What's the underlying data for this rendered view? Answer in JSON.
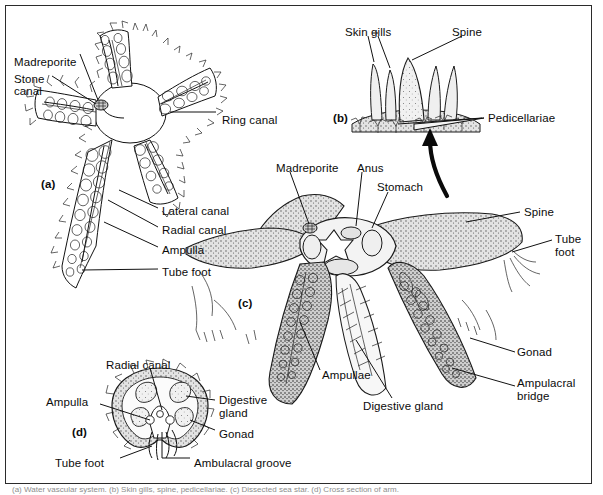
{
  "figure": {
    "panels": [
      {
        "id": "a",
        "tag": "(a)",
        "description": "water vascular system"
      },
      {
        "id": "b",
        "tag": "(b)",
        "description": "surface detail with skin gills, spine and pedicellariae"
      },
      {
        "id": "c",
        "tag": "(c)",
        "description": "whole animal dissected from aboral side"
      },
      {
        "id": "d",
        "tag": "(d)",
        "description": "cross section of an arm"
      }
    ],
    "panel_tags": {
      "a": "(a)",
      "b": "(b)",
      "c": "(c)",
      "d": "(d)"
    },
    "caption_sliver": "(a) Water vascular system. (b) Skin gills, spine, pedicellariae. (c) Dissected sea star. (d) Cross section of arm."
  },
  "labels": {
    "panel_a": [
      {
        "name": "madreporite",
        "text": "Madreporite",
        "x": 14,
        "y": 56
      },
      {
        "name": "stone-canal-line1",
        "text": "Stone",
        "x": 14,
        "y": 73
      },
      {
        "name": "stone-canal-line2",
        "text": "canal",
        "x": 14,
        "y": 85
      },
      {
        "name": "ring-canal",
        "text": "Ring canal",
        "x": 222,
        "y": 114
      },
      {
        "name": "lateral-canal",
        "text": "Lateral canal",
        "x": 162,
        "y": 211
      },
      {
        "name": "radial-canal",
        "text": "Radial canal",
        "x": 162,
        "y": 230
      },
      {
        "name": "ampulla",
        "text": "Ampulla",
        "x": 162,
        "y": 250
      },
      {
        "name": "tube-foot",
        "text": "Tube foot",
        "x": 162,
        "y": 272
      },
      {
        "name": "panel-a-tag",
        "text": "(a)",
        "x": 41,
        "y": 178,
        "bold": true
      }
    ],
    "panel_b": [
      {
        "name": "skin-gills",
        "text": "Skin gills",
        "x": 345,
        "y": 29
      },
      {
        "name": "spine",
        "text": "Spine",
        "x": 452,
        "y": 29
      },
      {
        "name": "pedicellariae",
        "text": "Pedicellariae",
        "x": 488,
        "y": 117
      },
      {
        "name": "panel-b-tag",
        "text": "(b)",
        "x": 333,
        "y": 117,
        "bold": true
      }
    ],
    "panel_c": [
      {
        "name": "madreporite-c",
        "text": "Madreporite",
        "x": 276,
        "y": 165
      },
      {
        "name": "anus",
        "text": "Anus",
        "x": 357,
        "y": 165
      },
      {
        "name": "stomach",
        "text": "Stomach",
        "x": 377,
        "y": 184
      },
      {
        "name": "spine-c",
        "text": "Spine",
        "x": 524,
        "y": 211
      },
      {
        "name": "tube-foot-c-line1",
        "text": "Tube",
        "x": 555,
        "y": 237
      },
      {
        "name": "tube-foot-c-line2",
        "text": "foot",
        "x": 555,
        "y": 250
      },
      {
        "name": "gonad-c",
        "text": "Gonad",
        "x": 517,
        "y": 350
      },
      {
        "name": "ampulacral-bridge-line1",
        "text": "Ampulacral",
        "x": 517,
        "y": 381
      },
      {
        "name": "ampulacral-bridge-line2",
        "text": "bridge",
        "x": 517,
        "y": 394
      },
      {
        "name": "ampullae",
        "text": "Ampullae",
        "x": 322,
        "y": 373
      },
      {
        "name": "digestive-gland-c",
        "text": "Digestive gland",
        "x": 363,
        "y": 404
      },
      {
        "name": "panel-c-tag",
        "text": "(c)",
        "x": 238,
        "y": 297,
        "bold": true
      }
    ],
    "panel_d": [
      {
        "name": "radial-canal-d",
        "text": "Radial canal",
        "x": 106,
        "y": 363
      },
      {
        "name": "ampulla-d",
        "text": "Ampulla",
        "x": 46,
        "y": 399
      },
      {
        "name": "digestive-gland-d-line1",
        "text": "Digestive",
        "x": 219,
        "y": 399
      },
      {
        "name": "digestive-gland-d-line2",
        "text": "gland",
        "x": 219,
        "y": 412
      },
      {
        "name": "gonad-d",
        "text": "Gonad",
        "x": 219,
        "y": 433
      },
      {
        "name": "tube-foot-d",
        "text": "Tube foot",
        "x": 55,
        "y": 461
      },
      {
        "name": "ambulacral-groove",
        "text": "Ambulacral groove",
        "x": 194,
        "y": 461
      },
      {
        "name": "panel-d-tag",
        "text": "(d)",
        "x": 72,
        "y": 430,
        "bold": true
      }
    ]
  },
  "colors": {
    "ink": "#111111",
    "frame": "#2b2b2b",
    "background": "#ffffff",
    "body_gray": "#d9d9d9",
    "light_gray": "#eaeaea"
  }
}
